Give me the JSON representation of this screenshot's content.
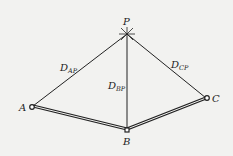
{
  "diagram": {
    "type": "survey-intersection",
    "points": {
      "P": {
        "label": "P",
        "x": 127,
        "y": 34
      },
      "A": {
        "label": "A",
        "x": 32,
        "y": 107
      },
      "B": {
        "label": "B",
        "x": 127,
        "y": 130
      },
      "C": {
        "label": "C",
        "x": 207,
        "y": 98
      }
    },
    "distances": {
      "AP": {
        "main": "D",
        "sub": "AP"
      },
      "BP": {
        "main": "D",
        "sub": "BP"
      },
      "CP": {
        "main": "D",
        "sub": "CP"
      }
    },
    "colors": {
      "line": "#222222",
      "background": "#f2f2f0"
    }
  }
}
